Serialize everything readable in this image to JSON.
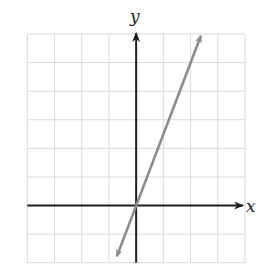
{
  "chart_data": {
    "type": "line",
    "title": "",
    "xlabel": "x",
    "ylabel": "y",
    "xlim": [
      -4,
      4
    ],
    "ylim": [
      -2,
      6
    ],
    "grid": true,
    "grid_step": 1,
    "tick_labels_shown": false,
    "series": [
      {
        "name": "line",
        "equation": "y = 2.5x",
        "slope": 2.5,
        "intercept": 0,
        "x": [
          -0.71,
          0,
          2,
          2.38
        ],
        "y": [
          -1.78,
          0,
          5,
          5.94
        ],
        "arrows_both_ends": true,
        "color": "#8c8c8c"
      }
    ]
  },
  "labels": {
    "x_axis": "x",
    "y_axis": "y"
  },
  "colors": {
    "axis": "#1e1e1e",
    "grid": "#d9d9d9",
    "line": "#8c8c8c",
    "background": "#ffffff"
  }
}
